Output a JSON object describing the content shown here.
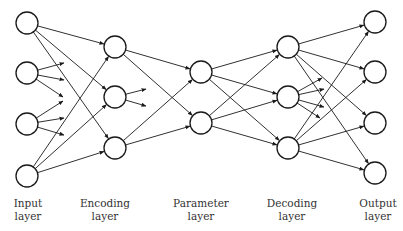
{
  "diagram": {
    "colors": {
      "stroke": "#1a1a1a",
      "node_fill": "#ffffff",
      "label": "#333333",
      "background": "#ffffff"
    },
    "node_radius": 11,
    "layers": [
      {
        "id": "input",
        "label_line1": "Input",
        "label_line2": "layer",
        "label_x": 28,
        "nodes": [
          {
            "x": 27,
            "y": 23
          },
          {
            "x": 27,
            "y": 73
          },
          {
            "x": 27,
            "y": 124
          },
          {
            "x": 27,
            "y": 176
          }
        ]
      },
      {
        "id": "encoding",
        "label_line1": "Encoding",
        "label_line2": "layer",
        "label_x": 105,
        "nodes": [
          {
            "x": 115,
            "y": 47
          },
          {
            "x": 115,
            "y": 97
          },
          {
            "x": 115,
            "y": 148
          }
        ]
      },
      {
        "id": "parameter",
        "label_line1": "Parameter",
        "label_line2": "layer",
        "label_x": 201,
        "nodes": [
          {
            "x": 201,
            "y": 72
          },
          {
            "x": 201,
            "y": 123
          }
        ]
      },
      {
        "id": "decoding",
        "label_line1": "Decoding",
        "label_line2": "layer",
        "label_x": 292,
        "nodes": [
          {
            "x": 288,
            "y": 47
          },
          {
            "x": 288,
            "y": 97
          },
          {
            "x": 288,
            "y": 148
          }
        ]
      },
      {
        "id": "output",
        "label_line1": "Output",
        "label_line2": "layer",
        "label_x": 378,
        "nodes": [
          {
            "x": 375,
            "y": 22
          },
          {
            "x": 375,
            "y": 72
          },
          {
            "x": 375,
            "y": 123
          },
          {
            "x": 375,
            "y": 173
          }
        ]
      }
    ],
    "label_y1": 207,
    "label_y2": 220,
    "edges": [
      {
        "from": [
          0,
          0
        ],
        "to": [
          1,
          0
        ]
      },
      {
        "from": [
          0,
          0
        ],
        "to": [
          1,
          1
        ]
      },
      {
        "from": [
          0,
          0
        ],
        "to": [
          1,
          2
        ]
      },
      {
        "from": [
          0,
          3
        ],
        "to": [
          1,
          0
        ]
      },
      {
        "from": [
          0,
          3
        ],
        "to": [
          1,
          1
        ]
      },
      {
        "from": [
          0,
          3
        ],
        "to": [
          1,
          2
        ]
      },
      {
        "from": [
          1,
          0
        ],
        "to": [
          2,
          0
        ]
      },
      {
        "from": [
          1,
          0
        ],
        "to": [
          2,
          1
        ]
      },
      {
        "from": [
          1,
          2
        ],
        "to": [
          2,
          0
        ]
      },
      {
        "from": [
          1,
          2
        ],
        "to": [
          2,
          1
        ]
      },
      {
        "from": [
          2,
          0
        ],
        "to": [
          3,
          0
        ]
      },
      {
        "from": [
          2,
          0
        ],
        "to": [
          3,
          1
        ]
      },
      {
        "from": [
          2,
          0
        ],
        "to": [
          3,
          2
        ]
      },
      {
        "from": [
          2,
          1
        ],
        "to": [
          3,
          0
        ]
      },
      {
        "from": [
          2,
          1
        ],
        "to": [
          3,
          1
        ]
      },
      {
        "from": [
          2,
          1
        ],
        "to": [
          3,
          2
        ]
      },
      {
        "from": [
          3,
          0
        ],
        "to": [
          4,
          0
        ]
      },
      {
        "from": [
          3,
          0
        ],
        "to": [
          4,
          1
        ]
      },
      {
        "from": [
          3,
          0
        ],
        "to": [
          4,
          2
        ]
      },
      {
        "from": [
          3,
          0
        ],
        "to": [
          4,
          3
        ]
      },
      {
        "from": [
          3,
          2
        ],
        "to": [
          4,
          0
        ]
      },
      {
        "from": [
          3,
          2
        ],
        "to": [
          4,
          1
        ]
      },
      {
        "from": [
          3,
          2
        ],
        "to": [
          4,
          2
        ]
      },
      {
        "from": [
          3,
          2
        ],
        "to": [
          4,
          3
        ]
      }
    ],
    "stubs": [
      {
        "from": [
          0,
          1
        ],
        "to": {
          "x": 64,
          "y": 63
        }
      },
      {
        "from": [
          0,
          1
        ],
        "to": {
          "x": 64,
          "y": 80
        }
      },
      {
        "from": [
          0,
          1
        ],
        "to": {
          "x": 63,
          "y": 97
        }
      },
      {
        "from": [
          0,
          2
        ],
        "to": {
          "x": 63,
          "y": 101
        }
      },
      {
        "from": [
          0,
          2
        ],
        "to": {
          "x": 64,
          "y": 118
        }
      },
      {
        "from": [
          0,
          2
        ],
        "to": {
          "x": 64,
          "y": 135
        }
      },
      {
        "from": [
          1,
          1
        ],
        "to": {
          "x": 146,
          "y": 89
        }
      },
      {
        "from": [
          1,
          1
        ],
        "to": {
          "x": 146,
          "y": 106
        }
      },
      {
        "from": [
          3,
          1
        ],
        "to": {
          "x": 322,
          "y": 78
        }
      },
      {
        "from": [
          3,
          1
        ],
        "to": {
          "x": 324,
          "y": 89
        }
      },
      {
        "from": [
          3,
          1
        ],
        "to": {
          "x": 324,
          "y": 107
        }
      },
      {
        "from": [
          3,
          1
        ],
        "to": {
          "x": 320,
          "y": 118
        }
      }
    ]
  }
}
